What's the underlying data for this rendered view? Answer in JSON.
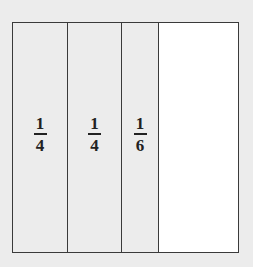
{
  "diagram": {
    "sections": [
      {
        "label": {
          "numerator": "1",
          "denominator": "4"
        },
        "shaded": true,
        "value": 0.25
      },
      {
        "label": {
          "numerator": "1",
          "denominator": "4"
        },
        "shaded": true,
        "value": 0.25
      },
      {
        "label": {
          "numerator": "1",
          "denominator": "6"
        },
        "shaded": true,
        "value": 0.1667
      },
      {
        "label": null,
        "shaded": false,
        "value": 0.3333
      }
    ],
    "colors": {
      "shaded": "#ececec",
      "unshaded": "#ffffff",
      "border": "#3a3a3a",
      "text": "#222222"
    }
  }
}
